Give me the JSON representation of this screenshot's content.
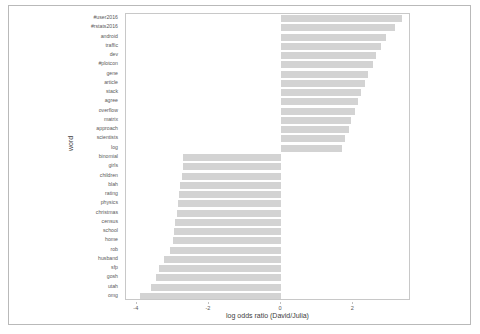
{
  "figure": {
    "outer_border_color": "#b9b9b9",
    "panel_border_color": "#c8c8c8",
    "bar_color": "#d3d3d3",
    "text_color": "#5a5a5a"
  },
  "axis": {
    "x_title": "log odds ratio (David/Julia)",
    "y_title": "word",
    "x_ticks": [
      "-4",
      "-2",
      "0",
      "2"
    ],
    "x_tick_values": [
      -4,
      -2,
      0,
      2
    ]
  },
  "chart_data": {
    "type": "bar",
    "orientation": "horizontal",
    "title": "",
    "xlabel": "log odds ratio (David/Julia)",
    "ylabel": "word",
    "xlim": [
      -4.3,
      3.6
    ],
    "grid": false,
    "legend": "none",
    "categories": [
      "#user2016",
      "#rstats2016",
      "android",
      "traffic",
      "dev",
      "#plotcon",
      "gene",
      "article",
      "stack",
      "agree",
      "overflow",
      "matrix",
      "approach",
      "scientists",
      "log",
      "binomial",
      "girls",
      "children",
      "blah",
      "rating",
      "physics",
      "christmas",
      "census",
      "school",
      "home",
      "rob",
      "husband",
      "sfp",
      "gosh",
      "utah",
      "omg"
    ],
    "values": [
      3.35,
      3.15,
      2.92,
      2.78,
      2.62,
      2.55,
      2.42,
      2.33,
      2.22,
      2.12,
      2.05,
      1.95,
      1.88,
      1.78,
      1.7,
      -2.72,
      -2.72,
      -2.75,
      -2.8,
      -2.83,
      -2.86,
      -2.9,
      -2.93,
      -2.97,
      -3.0,
      -3.08,
      -3.25,
      -3.38,
      -3.48,
      -3.6,
      -3.92
    ]
  }
}
